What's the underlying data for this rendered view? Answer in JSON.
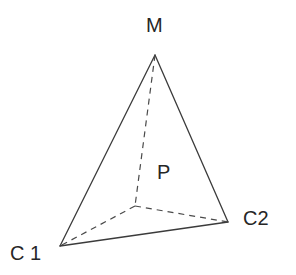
{
  "figure": {
    "name": "tetrahedron-diagram",
    "background_color": "#ffffff",
    "line_color": "#3b3b3b",
    "dashed_line_color": "#4a4a4a",
    "label_color": "#262626",
    "width": 296,
    "height": 275
  },
  "labels": {
    "apex": "M",
    "front_left": "C 1",
    "front_right": "C2",
    "interior": "P"
  },
  "vertices": [
    {
      "id": "M",
      "label": "M",
      "x": 155,
      "y": 55,
      "hidden": false
    },
    {
      "id": "C1",
      "label": "C 1",
      "x": 60,
      "y": 246,
      "hidden": false
    },
    {
      "id": "C2",
      "label": "C2",
      "x": 228,
      "y": 222,
      "hidden": false
    },
    {
      "id": "P",
      "label": "P",
      "x": 135,
      "y": 206,
      "hidden": true
    }
  ],
  "edges": [
    {
      "from": "M",
      "to": "C1",
      "style": "solid"
    },
    {
      "from": "M",
      "to": "C2",
      "style": "solid"
    },
    {
      "from": "C1",
      "to": "C2",
      "style": "solid"
    },
    {
      "from": "M",
      "to": "P",
      "style": "dashed"
    },
    {
      "from": "P",
      "to": "C1",
      "style": "dashed"
    },
    {
      "from": "P",
      "to": "C2",
      "style": "dashed"
    }
  ]
}
